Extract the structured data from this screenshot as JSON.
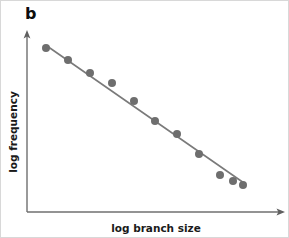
{
  "panel": {
    "label": "b",
    "width": 289,
    "height": 238,
    "background": "#ffffff",
    "border_color": "#d8d8d8"
  },
  "colors": {
    "axis": "#6f6f6f",
    "point_fill": "#6e6e6e",
    "trend_line": "#7a7a7a",
    "label_text": "#1a1a1a",
    "panel_label_text": "#0d0d0d"
  },
  "chart_data": {
    "type": "scatter",
    "title": "b",
    "xlabel": "log branch size",
    "ylabel": "log frequency",
    "legend": null,
    "grid": false,
    "xlim": [
      0,
      10
    ],
    "ylim": [
      0,
      10
    ],
    "axis_style": "arrow-ended L-frame, no tick marks, no tick labels",
    "series": [
      {
        "name": "observations",
        "marker": "filled-circle",
        "marker_color": "#6e6e6e",
        "marker_radius_px": 4,
        "x": [
          1.0,
          2.05,
          2.99,
          4.06,
          5.02,
          6.02,
          7.07,
          8.02,
          9.05,
          9.96,
          11.0
        ],
        "y": [
          9.45,
          8.8,
          8.05,
          7.45,
          6.45,
          5.7,
          5.05,
          3.8,
          2.55,
          2.15,
          1.55
        ],
        "points_px": [
          {
            "x": 45,
            "y": 47
          },
          {
            "x": 67,
            "y": 59
          },
          {
            "x": 89,
            "y": 72
          },
          {
            "x": 111,
            "y": 82
          },
          {
            "x": 133,
            "y": 100
          },
          {
            "x": 154,
            "y": 120
          },
          {
            "x": 176,
            "y": 133
          },
          {
            "x": 198,
            "y": 153
          },
          {
            "x": 219,
            "y": 174
          },
          {
            "x": 232,
            "y": 180
          },
          {
            "x": 242,
            "y": 184
          }
        ]
      }
    ],
    "fit_line": {
      "name": "power-law fit",
      "color": "#7a7a7a",
      "width_px": 1.6,
      "start_px": {
        "x": 46,
        "y": 45
      },
      "end_px": {
        "x": 243,
        "y": 182
      },
      "description": "straight negative-slope line through the points (power law on log-log axes)"
    }
  },
  "axes": {
    "y_axis": {
      "x_px": 26,
      "top_px": 31,
      "bottom_px": 211,
      "arrow": "up"
    },
    "x_axis": {
      "y_px": 211,
      "left_px": 26,
      "right_px": 283,
      "arrow": "right"
    }
  }
}
